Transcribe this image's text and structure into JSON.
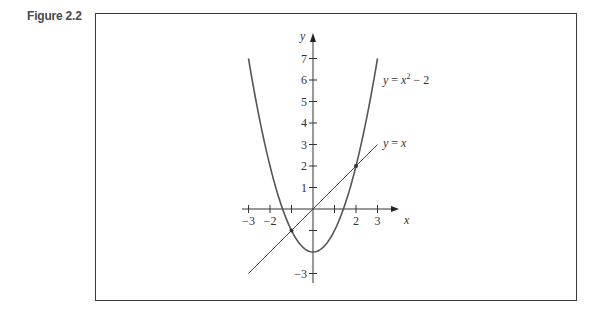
{
  "figure": {
    "label": "Figure 2.2"
  },
  "chart_data": {
    "type": "line",
    "title": "",
    "xlabel": "x",
    "ylabel": "y",
    "xlim": [
      -3,
      3
    ],
    "ylim": [
      -3,
      7
    ],
    "x_ticks": [
      -3,
      -2,
      -1,
      0,
      1,
      2,
      3
    ],
    "x_tick_labels": [
      "−3",
      "−2",
      "",
      "",
      "",
      "2",
      "3"
    ],
    "y_ticks": [
      -3,
      -2,
      -1,
      1,
      2,
      3,
      4,
      5,
      6,
      7
    ],
    "y_tick_labels": [
      "−3",
      "",
      "",
      "1",
      "2",
      "3",
      "4",
      "5",
      "6",
      "7"
    ],
    "grid": false,
    "series": [
      {
        "name": "y = x² − 2",
        "label_parts": {
          "y": "y",
          "eq": " = ",
          "x": "x",
          "sup": "2",
          "rest": " − 2"
        },
        "function": "x^2 - 2",
        "x": [
          -3,
          -2.5,
          -2,
          -1.5,
          -1,
          -0.5,
          0,
          0.5,
          1,
          1.5,
          2,
          2.5,
          3
        ],
        "values": [
          7,
          4.25,
          2,
          0.25,
          -1,
          -1.75,
          -2,
          -1.75,
          -1,
          0.25,
          2,
          4.25,
          7
        ]
      },
      {
        "name": "y = x",
        "label_parts": {
          "y": "y",
          "eq": " = ",
          "x": "x"
        },
        "function": "x",
        "x": [
          -3,
          3
        ],
        "values": [
          -3,
          3
        ]
      }
    ],
    "intersection_points": [
      {
        "x": -1,
        "y": -1
      },
      {
        "x": 2,
        "y": 2
      }
    ]
  }
}
